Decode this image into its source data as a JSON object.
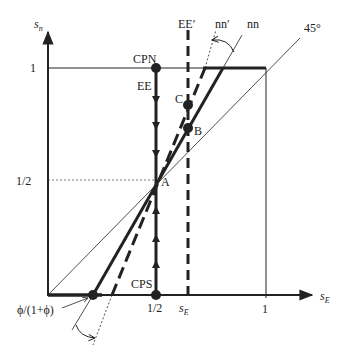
{
  "axes": {
    "y_label": "s",
    "y_sub": "n",
    "x_label": "s",
    "x_sub": "E",
    "y_tick_1": "1",
    "y_tick_half": "1/2",
    "x_tick_half": "1/2",
    "x_tick_1": "1",
    "x_tick_sE_prime": "s",
    "x_tick_sE_prime_sub": "E",
    "x_tick_sE_prime_sup": "/"
  },
  "labels": {
    "cpn": "CPN",
    "ee": "EE",
    "ee_prime": "EE′",
    "nn_prime": "nn′",
    "nn": "nn",
    "deg45": "45°",
    "c": "C",
    "b": "B",
    "a": "A",
    "cps": "CPS",
    "phi": "ϕ/(1+ϕ)"
  },
  "colors": {
    "ink": "#222222"
  }
}
